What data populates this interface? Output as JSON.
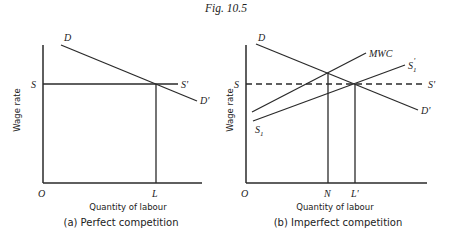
{
  "figure_title": "Fig. 10.5",
  "panels": [
    {
      "id": "a",
      "caption": "(a) Perfect competition",
      "ylabel": "Wage rate",
      "xlabel": "Quantity of labour",
      "labels": {
        "origin": "O",
        "demand_start": "D",
        "demand_end": "D'",
        "supply_start": "S",
        "supply_end": "S'",
        "quantity": "L"
      }
    },
    {
      "id": "b",
      "caption": "(b) Imperfect competition",
      "ylabel": "Wage rate",
      "xlabel": "Quantity of labour",
      "labels": {
        "origin": "O",
        "demand_start": "D",
        "demand_end": "D'",
        "supply_start": "S",
        "supply_end": "S'",
        "mwc": "MWC",
        "s1_start": "S",
        "s1_start_sub": "1",
        "s1_end": "S",
        "s1_end_sub": "1",
        "s1_end_prime": "'",
        "quantity_n": "N",
        "quantity_l": "L'"
      }
    }
  ]
}
